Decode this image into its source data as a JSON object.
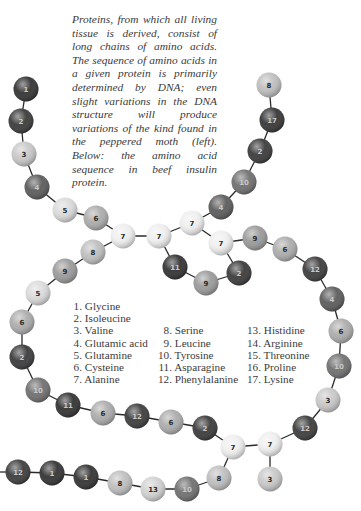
{
  "caption": "Proteins, from which all living tissue is derived, consist of long chains of amino acids. The sequence of amino acids in a given protein is primarily determined by DNA; even slight variations in the DNA structure will produce variations of the kind found in the peppered moth (left). Below: the amino acid sequence in beef insulin protein.",
  "legend": {
    "columns": [
      {
        "x": 72,
        "start_row": 0,
        "items": [
          {
            "n": "1.",
            "name": "Glycine"
          },
          {
            "n": "2.",
            "name": "Isoleucine"
          },
          {
            "n": "3.",
            "name": "Valine"
          },
          {
            "n": "4.",
            "name": "Glutamic acid"
          },
          {
            "n": "5.",
            "name": "Glutamine"
          },
          {
            "n": "6.",
            "name": "Cysteine"
          },
          {
            "n": "7.",
            "name": "Alanine"
          }
        ]
      },
      {
        "x": 157,
        "start_row": 2,
        "items": [
          {
            "n": "8.",
            "name": "Serine"
          },
          {
            "n": "9.",
            "name": "Leucine"
          },
          {
            "n": "10.",
            "name": "Tyrosine"
          },
          {
            "n": "11.",
            "name": "Asparagine"
          },
          {
            "n": "12.",
            "name": "Phenylalanine"
          }
        ]
      },
      {
        "x": 246,
        "start_row": 2,
        "items": [
          {
            "n": "13.",
            "name": "Histidine"
          },
          {
            "n": "14.",
            "name": "Arginine"
          },
          {
            "n": "15.",
            "name": "Threonine"
          },
          {
            "n": "16.",
            "name": "Proline"
          },
          {
            "n": "17.",
            "name": "Lysine"
          }
        ]
      }
    ]
  },
  "bead_colors": {
    "1": "#2c2c2c",
    "2": "#343434",
    "3": "#c6c6c6",
    "4": "#565656",
    "5": "#d9d9d9",
    "6": "#a9a9a9",
    "7": "#eeeeee",
    "8": "#bcbcbc",
    "9": "#979797",
    "10": "#6b6b6b",
    "11": "#2b2b2b",
    "12": "#363636",
    "13": "#d0d0d0",
    "14": "#777777",
    "15": "#999999",
    "16": "#888888",
    "17": "#2f2f2f"
  },
  "beads": [
    {
      "id": "a1",
      "n": 1,
      "x": 26,
      "y": 89
    },
    {
      "id": "a2",
      "n": 2,
      "x": 21,
      "y": 121
    },
    {
      "id": "a3",
      "n": 3,
      "x": 24,
      "y": 154
    },
    {
      "id": "a4",
      "n": 4,
      "x": 37,
      "y": 187
    },
    {
      "id": "a5",
      "n": 5,
      "x": 65,
      "y": 210
    },
    {
      "id": "a6",
      "n": 6,
      "x": 96,
      "y": 218
    },
    {
      "id": "a7",
      "n": 7,
      "x": 123,
      "y": 236
    },
    {
      "id": "a8",
      "n": 7,
      "x": 159,
      "y": 236
    },
    {
      "id": "b1",
      "n": 8,
      "x": 93,
      "y": 252
    },
    {
      "id": "b2",
      "n": 9,
      "x": 65,
      "y": 271
    },
    {
      "id": "b3",
      "n": 5,
      "x": 38,
      "y": 293
    },
    {
      "id": "b4",
      "n": 6,
      "x": 22,
      "y": 322
    },
    {
      "id": "b5",
      "n": 2,
      "x": 22,
      "y": 357
    },
    {
      "id": "b6",
      "n": 10,
      "x": 38,
      "y": 390
    },
    {
      "id": "b7",
      "n": 11,
      "x": 68,
      "y": 405
    },
    {
      "id": "b8",
      "n": 6,
      "x": 103,
      "y": 413
    },
    {
      "id": "b9",
      "n": 12,
      "x": 137,
      "y": 416
    },
    {
      "id": "b10",
      "n": 6,
      "x": 171,
      "y": 422
    },
    {
      "id": "b11",
      "n": 2,
      "x": 205,
      "y": 428
    },
    {
      "id": "b12",
      "n": 7,
      "x": 233,
      "y": 447
    },
    {
      "id": "b13",
      "n": 7,
      "x": 270,
      "y": 444
    },
    {
      "id": "b14",
      "n": 3,
      "x": 270,
      "y": 479
    },
    {
      "id": "c1",
      "n": 8,
      "x": 269,
      "y": 85
    },
    {
      "id": "c2",
      "n": 17,
      "x": 272,
      "y": 120
    },
    {
      "id": "c3",
      "n": 2,
      "x": 260,
      "y": 151
    },
    {
      "id": "c4",
      "n": 10,
      "x": 244,
      "y": 182
    },
    {
      "id": "c5",
      "n": 4,
      "x": 221,
      "y": 207
    },
    {
      "id": "c6",
      "n": 7,
      "x": 192,
      "y": 223
    },
    {
      "id": "c7",
      "n": 7,
      "x": 221,
      "y": 243
    },
    {
      "id": "c8",
      "n": 9,
      "x": 255,
      "y": 238
    },
    {
      "id": "c9",
      "n": 6,
      "x": 285,
      "y": 249
    },
    {
      "id": "c10",
      "n": 12,
      "x": 315,
      "y": 269
    },
    {
      "id": "c11",
      "n": 4,
      "x": 332,
      "y": 299
    },
    {
      "id": "c12",
      "n": 6,
      "x": 341,
      "y": 331
    },
    {
      "id": "c13",
      "n": 10,
      "x": 339,
      "y": 366
    },
    {
      "id": "c14",
      "n": 3,
      "x": 328,
      "y": 400
    },
    {
      "id": "c15",
      "n": 12,
      "x": 305,
      "y": 428
    },
    {
      "id": "d1",
      "n": 11,
      "x": 175,
      "y": 267
    },
    {
      "id": "d2",
      "n": 9,
      "x": 206,
      "y": 283
    },
    {
      "id": "d3",
      "n": 2,
      "x": 239,
      "y": 273
    },
    {
      "id": "e1",
      "n": 12,
      "x": 18,
      "y": 472
    },
    {
      "id": "e2",
      "n": 1,
      "x": 52,
      "y": 473
    },
    {
      "id": "e3",
      "n": 1,
      "x": 86,
      "y": 477
    },
    {
      "id": "e4",
      "n": 8,
      "x": 120,
      "y": 483
    },
    {
      "id": "e5",
      "n": 13,
      "x": 153,
      "y": 489
    },
    {
      "id": "e6",
      "n": 10,
      "x": 187,
      "y": 489
    },
    {
      "id": "e7",
      "n": 8,
      "x": 219,
      "y": 478
    }
  ],
  "bonds": [
    [
      "a1",
      "a2"
    ],
    [
      "a2",
      "a3"
    ],
    [
      "a3",
      "a4"
    ],
    [
      "a4",
      "a5"
    ],
    [
      "a5",
      "a6"
    ],
    [
      "a6",
      "a7"
    ],
    [
      "a7",
      "a8"
    ],
    [
      "a7",
      "b1"
    ],
    [
      "b1",
      "b2"
    ],
    [
      "b2",
      "b3"
    ],
    [
      "b3",
      "b4"
    ],
    [
      "b4",
      "b5"
    ],
    [
      "b5",
      "b6"
    ],
    [
      "b6",
      "b7"
    ],
    [
      "b7",
      "b8"
    ],
    [
      "b8",
      "b9"
    ],
    [
      "b9",
      "b10"
    ],
    [
      "b10",
      "b11"
    ],
    [
      "b11",
      "b12"
    ],
    [
      "b12",
      "b13"
    ],
    [
      "b13",
      "b14"
    ],
    [
      "b13",
      "c15"
    ],
    [
      "c1",
      "c2"
    ],
    [
      "c2",
      "c3"
    ],
    [
      "c3",
      "c4"
    ],
    [
      "c4",
      "c5"
    ],
    [
      "c5",
      "c6"
    ],
    [
      "c6",
      "c7"
    ],
    [
      "c7",
      "c8"
    ],
    [
      "c8",
      "c9"
    ],
    [
      "c9",
      "c10"
    ],
    [
      "c10",
      "c11"
    ],
    [
      "c11",
      "c12"
    ],
    [
      "c12",
      "c13"
    ],
    [
      "c13",
      "c14"
    ],
    [
      "c14",
      "c15"
    ],
    [
      "a8",
      "c6"
    ],
    [
      "a8",
      "d1"
    ],
    [
      "d1",
      "d2"
    ],
    [
      "d2",
      "d3"
    ],
    [
      "d3",
      "c7"
    ],
    [
      "e1",
      "e2"
    ],
    [
      "e2",
      "e3"
    ],
    [
      "e3",
      "e4"
    ],
    [
      "e4",
      "e5"
    ],
    [
      "e5",
      "e6"
    ],
    [
      "e6",
      "e7"
    ],
    [
      "e7",
      "b12"
    ]
  ],
  "offscreen_bond": {
    "from": "e1",
    "to_x": 0,
    "to_y": 472
  },
  "bead_radius": 12.5
}
